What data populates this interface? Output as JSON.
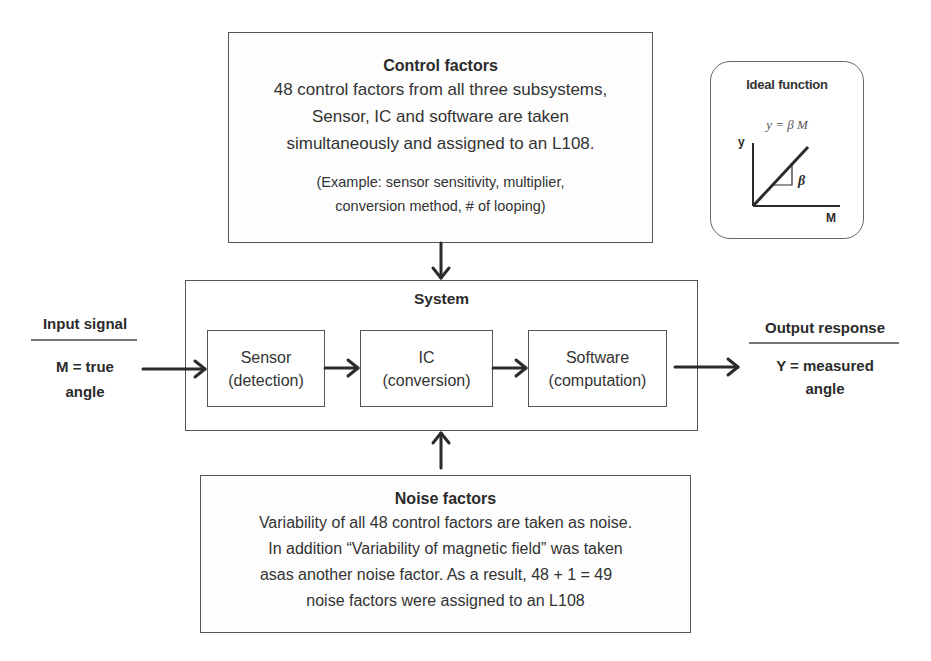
{
  "control_factors": {
    "title": "Control factors",
    "lines": [
      "48 control factors from all three subsystems,",
      "Sensor, IC and software are taken",
      "simultaneously and assigned to an L108."
    ],
    "example_lines": [
      "(Example: sensor sensitivity, multiplier,",
      "conversion method, # of looping)"
    ]
  },
  "ideal_function": {
    "title": "Ideal function",
    "equation": "y = β M",
    "y_axis_label": "y",
    "x_axis_label": "M",
    "slope_label": "β"
  },
  "input_signal": {
    "title": "Input signal",
    "value_lines": [
      "M = true",
      "angle"
    ]
  },
  "system": {
    "title": "System",
    "subsystems": [
      {
        "name": "Sensor",
        "role": "(detection)"
      },
      {
        "name": "IC",
        "role": "(conversion)"
      },
      {
        "name": "Software",
        "role": "(computation)"
      }
    ]
  },
  "output_response": {
    "title": "Output response",
    "value_lines": [
      "Y = measured",
      "angle"
    ]
  },
  "noise_factors": {
    "title": "Noise factors",
    "lines": [
      "Variability of all 48 control factors are taken as noise.",
      "In addition “Variability of magnetic field” was taken",
      "asas another noise factor. As a result, 48 + 1 = 49",
      "noise factors were assigned to an L108"
    ]
  },
  "colors": {
    "line": "#2b2b2b",
    "box_border": "#555555",
    "background": "#ffffff"
  }
}
